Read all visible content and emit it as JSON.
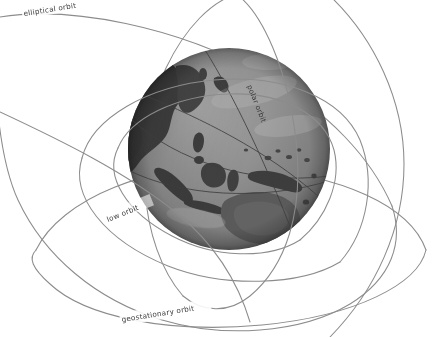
{
  "diagram": {
    "background_color": "#ffffff",
    "orbit_line_color": "#8c8c8c",
    "label_color": "#3b3b3b",
    "globe": {
      "name": "earth-globe",
      "center_x": 229,
      "center_y": 149,
      "radius": 101,
      "ocean_color": "#8e8e8e",
      "land_color": "#3c3c3c",
      "terminator_shadow": "#5f5f5f",
      "highlight_color": "#b9b9b9",
      "visible_regions": [
        "Asia",
        "Indonesia",
        "Australia",
        "Pacific Ocean"
      ]
    },
    "labels": [
      {
        "id": "elliptical",
        "text": "elliptical orbit",
        "x": 24,
        "y": 16,
        "rotation": -9
      },
      {
        "id": "polar",
        "text": "polar orbit",
        "x": 247,
        "y": 86,
        "rotation": 68
      },
      {
        "id": "low",
        "text": "low orbit",
        "x": 108,
        "y": 222,
        "rotation": -22
      },
      {
        "id": "geostationary",
        "text": "geostationary orbit",
        "x": 122,
        "y": 322,
        "rotation": -9
      }
    ],
    "orbits": [
      {
        "id": "elliptical-orbit",
        "label": "elliptical orbit",
        "type": "ellipse"
      },
      {
        "id": "polar-orbit",
        "label": "polar orbit",
        "type": "ellipse"
      },
      {
        "id": "low-orbit",
        "label": "low orbit",
        "type": "ellipse"
      },
      {
        "id": "geostationary-orbit",
        "label": "geostationary orbit",
        "type": "ellipse"
      }
    ]
  }
}
